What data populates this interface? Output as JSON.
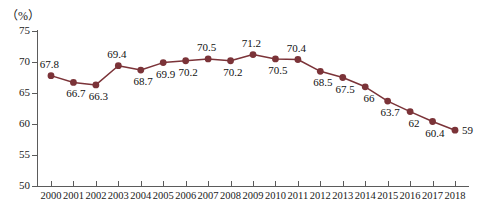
{
  "chart_data": {
    "type": "line",
    "title": "",
    "subtitle": "",
    "xlabel": "",
    "ylabel": "",
    "unit_label": "（%）",
    "categories": [
      "2000",
      "2001",
      "2002",
      "2003",
      "2004",
      "2005",
      "2006",
      "2007",
      "2008",
      "2009",
      "2010",
      "2011",
      "2012",
      "2013",
      "2014",
      "2015",
      "2016",
      "2017",
      "2018"
    ],
    "values": [
      67.8,
      66.7,
      66.3,
      69.4,
      68.7,
      69.9,
      70.2,
      70.5,
      70.2,
      71.2,
      70.5,
      70.4,
      68.5,
      67.5,
      66,
      63.7,
      62,
      60.4,
      59
    ],
    "point_labels": [
      "67.8",
      "66.7",
      "66.3",
      "69.4",
      "68.7",
      "69.9",
      "70.2",
      "70.5",
      "70.2",
      "71.2",
      "70.5",
      "70.4",
      "68.5",
      "67.5",
      "66",
      "63.7",
      "62",
      "60.4",
      "59"
    ],
    "label_positions": [
      "above",
      "below",
      "below",
      "above",
      "below",
      "below",
      "below",
      "above",
      "below",
      "above",
      "below",
      "above",
      "below",
      "below",
      "below",
      "below",
      "below",
      "below",
      "right"
    ],
    "ylim": [
      50,
      75
    ],
    "yticks": [
      75,
      70,
      65,
      60,
      55,
      50
    ],
    "ytick_labels": [
      "75",
      "70",
      "65",
      "60",
      "55",
      "50"
    ],
    "grid": false,
    "legend": "none",
    "series_color": "#7B3338",
    "marker_color": "#7B3338",
    "axis_color": "#5B5B5B",
    "text_color": "#1A1A1A",
    "background": "#FFFFFF"
  }
}
